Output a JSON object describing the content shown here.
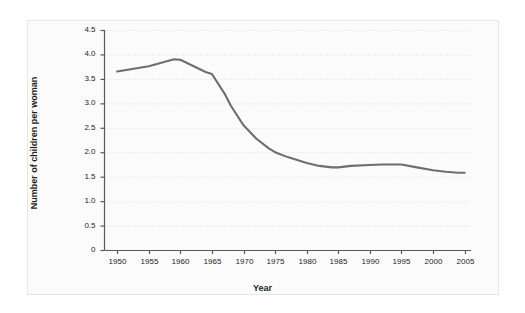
{
  "chart_data": {
    "type": "line",
    "title": "",
    "xlabel": "Year",
    "ylabel": "Number of children per woman",
    "xlim": [
      1948,
      2006
    ],
    "ylim": [
      0,
      4.5
    ],
    "grid": true,
    "legend": null,
    "line_color": "#6e6e6e",
    "x_tick_labels": [
      "1950",
      "1955",
      "1960",
      "1965",
      "1970",
      "1975",
      "1980",
      "1985",
      "1990",
      "1995",
      "2000",
      "2005"
    ],
    "y_tick_labels": [
      "4.5",
      "4.0",
      "3.5",
      "3.0",
      "2.5",
      "2.0",
      "1.5",
      "1.0",
      "0.5",
      "0"
    ],
    "x": [
      1950,
      1955,
      1959,
      1960,
      1964,
      1965,
      1967,
      1968,
      1970,
      1972,
      1974,
      1975,
      1977,
      1980,
      1982,
      1984,
      1985,
      1987,
      1990,
      1992,
      1994,
      1995,
      1997,
      2000,
      2002,
      2004,
      2005
    ],
    "values": [
      3.65,
      3.76,
      3.9,
      3.89,
      3.64,
      3.6,
      3.2,
      2.95,
      2.55,
      2.28,
      2.08,
      2.0,
      1.9,
      1.78,
      1.72,
      1.69,
      1.69,
      1.72,
      1.74,
      1.75,
      1.75,
      1.75,
      1.7,
      1.63,
      1.6,
      1.58,
      1.58
    ],
    "series": [
      {
        "name": "Number of children per woman",
        "values": [
          3.65,
          3.76,
          3.9,
          3.89,
          3.64,
          3.6,
          3.2,
          2.95,
          2.55,
          2.28,
          2.08,
          2.0,
          1.9,
          1.78,
          1.72,
          1.69,
          1.69,
          1.72,
          1.74,
          1.75,
          1.75,
          1.75,
          1.7,
          1.63,
          1.6,
          1.58,
          1.58
        ]
      }
    ]
  },
  "axes": {
    "x_title": "Year",
    "y_title": "Number of children per woman"
  },
  "y_ticks": [
    {
      "label": "4.5",
      "value": 4.5
    },
    {
      "label": "4.0",
      "value": 4.0
    },
    {
      "label": "3.5",
      "value": 3.5
    },
    {
      "label": "3.0",
      "value": 3.0
    },
    {
      "label": "2.5",
      "value": 2.5
    },
    {
      "label": "2.0",
      "value": 2.0
    },
    {
      "label": "1.5",
      "value": 1.5
    },
    {
      "label": "1.0",
      "value": 1.0
    },
    {
      "label": "0.5",
      "value": 0.5
    },
    {
      "label": "0",
      "value": 0
    }
  ],
  "x_ticks": [
    {
      "label": "1950",
      "value": 1950
    },
    {
      "label": "1955",
      "value": 1955
    },
    {
      "label": "1960",
      "value": 1960
    },
    {
      "label": "1965",
      "value": 1965
    },
    {
      "label": "1970",
      "value": 1970
    },
    {
      "label": "1975",
      "value": 1975
    },
    {
      "label": "1980",
      "value": 1980
    },
    {
      "label": "1985",
      "value": 1985
    },
    {
      "label": "1990",
      "value": 1990
    },
    {
      "label": "1995",
      "value": 1995
    },
    {
      "label": "2000",
      "value": 2000
    },
    {
      "label": "2005",
      "value": 2005
    }
  ],
  "colors": {
    "line": "#6e6e6e",
    "axis": "#58595b",
    "grid": "#d8d8d8",
    "text": "#231f20",
    "panel_bg": "#fbfbfb",
    "panel_border": "#e6e6e6"
  }
}
